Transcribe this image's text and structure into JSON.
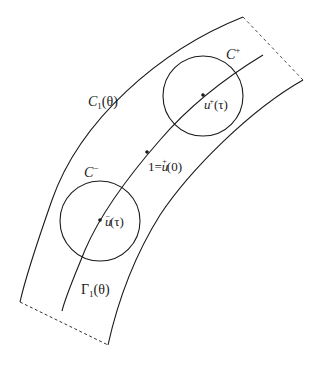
{
  "diagram": {
    "labels": {
      "outer_curve": "C",
      "outer_curve_sub": "1",
      "outer_curve_arg": "(θ)",
      "inner_curve": "Γ",
      "inner_curve_sub": "1",
      "inner_curve_arg": "(θ)",
      "circle_plus": "C",
      "circle_plus_sup": "+",
      "circle_minus": "C",
      "circle_minus_sup": "−",
      "point_plus": "u",
      "point_plus_sup": "+",
      "point_plus_arg": "(τ)",
      "point_minus": "u",
      "point_minus_sup": "−",
      "point_minus_arg": "(τ)",
      "point_origin_prefix": "1=",
      "point_origin": "u",
      "point_origin_sup": "+",
      "point_origin_arg": "(0)"
    },
    "colors": {
      "stroke": "#1a1a1a",
      "background": "#ffffff"
    }
  }
}
